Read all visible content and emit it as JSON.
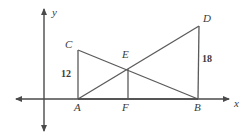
{
  "figure": {
    "type": "geometry-diagram",
    "background_color": "#ffffff",
    "stroke_color": "#5a5a5a",
    "label_color": "#3a3a3a"
  },
  "axes": {
    "x_axis_label": "x",
    "y_axis_label": "y",
    "x_axis": {
      "y": 99,
      "x_start": 16,
      "x_end": 229
    },
    "y_axis": {
      "x": 44,
      "y_start": 9,
      "y_end": 131
    },
    "x_label_pos": {
      "x": 234,
      "y": 104
    },
    "y_label_pos": {
      "x": 52,
      "y": 14
    }
  },
  "points": [
    {
      "name": "A",
      "x": 78,
      "y": 99,
      "label_x": 74,
      "label_y": 106
    },
    {
      "name": "B",
      "x": 198,
      "y": 99,
      "label_x": 195,
      "label_y": 106
    },
    {
      "name": "C",
      "x": 78,
      "y": 50,
      "label_x": 65,
      "label_y": 41
    },
    {
      "name": "D",
      "x": 199,
      "y": 26,
      "label_x": 203,
      "label_y": 15
    },
    {
      "name": "E",
      "x": 128,
      "y": 69,
      "label_x": 123,
      "label_y": 50
    },
    {
      "name": "F",
      "x": 128,
      "y": 99,
      "label_x": 123,
      "label_y": 106
    }
  ],
  "segments": [
    {
      "name": "CA",
      "from": "C",
      "to": "A"
    },
    {
      "name": "CB",
      "from": "C",
      "to": "B"
    },
    {
      "name": "AD",
      "from": "A",
      "to": "D"
    },
    {
      "name": "DB",
      "from": "D",
      "to": "B"
    },
    {
      "name": "EF",
      "from": "E",
      "to": "F"
    }
  ],
  "measurements": [
    {
      "name": "CA-length",
      "value": "12",
      "x": 61,
      "y": 69,
      "segment": "CA"
    },
    {
      "name": "DB-length",
      "value": "18",
      "x": 202,
      "y": 54,
      "segment": "DB"
    }
  ]
}
